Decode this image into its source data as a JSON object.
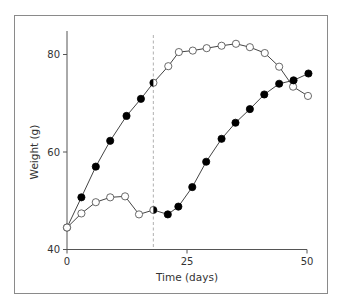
{
  "chart_data": {
    "type": "line",
    "title": "",
    "xlabel": "Time (days)",
    "ylabel": "Weight (g)",
    "xlim": [
      0,
      50
    ],
    "ylim": [
      40,
      84
    ],
    "xticks": [
      0,
      25,
      50
    ],
    "yticks": [
      40,
      60,
      80
    ],
    "grid": false,
    "legend": null,
    "annotations": [
      {
        "type": "vertical-dashed-line",
        "x": 18,
        "color": "#bdbdbd"
      }
    ],
    "marker_note": "Marker fill indicates condition; fills swap at the dashed line (day 18)",
    "series": [
      {
        "name": "Series A",
        "x": [
          0,
          3,
          6,
          9,
          12.4,
          15.4,
          18,
          21.1,
          23.3,
          26.2,
          29.1,
          32.2,
          35.2,
          38.1,
          41.2,
          44.2,
          47.1,
          50.2
        ],
        "values": [
          44.5,
          50.7,
          57.0,
          62.3,
          67.4,
          70.9,
          74.2,
          77.6,
          80.5,
          80.8,
          81.3,
          81.8,
          82.2,
          81.5,
          80.3,
          77.5,
          73.4,
          71.5
        ],
        "markers": [
          "open",
          "filled",
          "filled",
          "filled",
          "filled",
          "filled",
          "half-filled-left",
          "open",
          "open",
          "open",
          "open",
          "open",
          "open",
          "open",
          "open",
          "open",
          "open",
          "open"
        ]
      },
      {
        "name": "Series B",
        "x": [
          0,
          3,
          6,
          9,
          12.1,
          15,
          18,
          21,
          23.2,
          26.1,
          29,
          32.2,
          35.1,
          38.1,
          41.1,
          44.2,
          47.2,
          50.3
        ],
        "values": [
          44.5,
          47.4,
          49.7,
          50.7,
          50.9,
          47.2,
          48.1,
          47.2,
          48.8,
          52.8,
          58.0,
          62.7,
          66.0,
          68.8,
          71.8,
          74.0,
          74.7,
          76.1
        ],
        "markers": [
          "open",
          "open",
          "open",
          "open",
          "open",
          "open",
          "half-filled-right",
          "filled",
          "filled",
          "filled",
          "filled",
          "filled",
          "filled",
          "filled",
          "filled",
          "filled",
          "filled",
          "filled"
        ]
      }
    ]
  },
  "colors": {
    "line": "#444444",
    "marker_fill": "#000000",
    "marker_open_fill": "#ffffff",
    "axis": "#555555",
    "frame": "#8a8a8a",
    "dashed_line": "#bdbdbd"
  }
}
